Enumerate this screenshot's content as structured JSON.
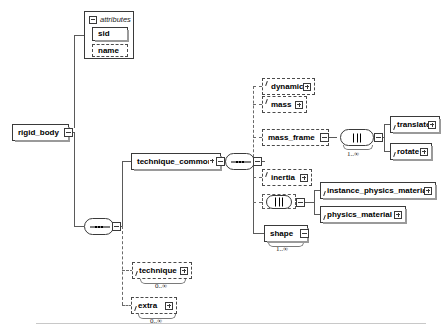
{
  "diagram": {
    "root": {
      "name": "rigid_body",
      "icon": "expand-plus-icon"
    },
    "attributes_panel": {
      "header_label": "attributes",
      "collapse_icon": "collapse-minus-icon",
      "items": [
        {
          "name": "sid",
          "required": true
        },
        {
          "name": "name",
          "required": false
        }
      ]
    },
    "nodes": {
      "technique_common": {
        "label": "technique_common"
      },
      "dynamic": {
        "label": "dynamic"
      },
      "mass": {
        "label": "mass"
      },
      "mass_frame": {
        "label": "mass_frame"
      },
      "translate": {
        "label": "translate"
      },
      "rotate": {
        "label": "rotate"
      },
      "inertia": {
        "label": "inertia"
      },
      "instance_physics_material": {
        "label": "instance_physics_material"
      },
      "physics_material": {
        "label": "physics_material"
      },
      "shape": {
        "label": "shape"
      },
      "technique": {
        "label": "technique"
      },
      "extra": {
        "label": "extra"
      }
    },
    "cardinalities": {
      "mass_frame_children": "1..∞",
      "shape": "1..∞",
      "technique": "0..∞",
      "extra": "0..∞"
    },
    "compositors": {
      "root_sequence": "sequence-compositor",
      "technique_common_sequence": "sequence-compositor",
      "mass_frame_choice": "choice-compositor",
      "material_choice": "choice-compositor"
    },
    "colors": {
      "line": "#5a5a5a",
      "border": "#3a3a3a",
      "text": "#000000",
      "shadow": "#9a9a9a",
      "rule": "#c8c8c8"
    }
  }
}
